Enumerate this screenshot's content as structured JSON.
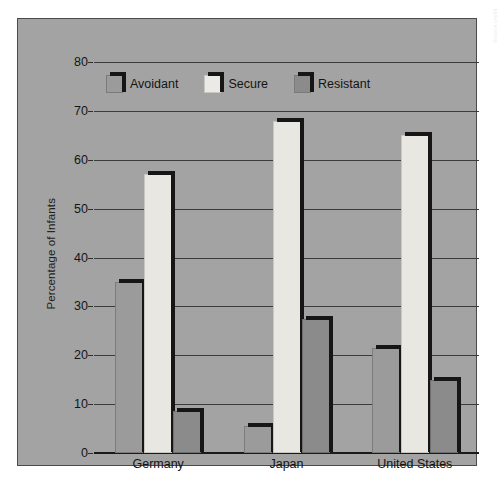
{
  "figure": {
    "background_color": "#ffffff",
    "panel_color": "#a3a3a3",
    "border_color": "#4a4a4a",
    "margin_credit": "Source credit"
  },
  "chart_data": {
    "type": "bar",
    "title": "",
    "xlabel": "",
    "ylabel": "Percentage of Infants",
    "ylim": [
      0,
      80
    ],
    "yticks": [
      0,
      10,
      20,
      30,
      40,
      50,
      60,
      70,
      80
    ],
    "ytick_labels": [
      "0",
      "10",
      "20",
      "30",
      "40",
      "50",
      "60",
      "70",
      "80"
    ],
    "grid": true,
    "grid_axis": "y",
    "legend_position": "upper-left-inside",
    "categories": [
      "Germany",
      "Japan",
      "United States"
    ],
    "series": [
      {
        "name": "Avoidant",
        "color": "#9b9b9b",
        "values": [
          35,
          5.5,
          21.5
        ]
      },
      {
        "name": "Secure",
        "color": "#e9e7e2",
        "values": [
          57,
          68,
          65
        ]
      },
      {
        "name": "Resistant",
        "color": "#8b8b8b",
        "values": [
          8.5,
          27.5,
          15
        ]
      }
    ]
  }
}
